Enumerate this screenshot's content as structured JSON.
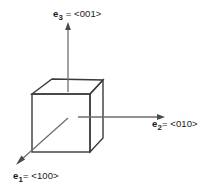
{
  "figure": {
    "background_color": "#ffffff",
    "line_color": "#3a3a3a",
    "text_color": "#1a1a1a"
  },
  "labels": {
    "e3": {
      "vector": "e",
      "subscript": "3",
      "rest": " = <001>",
      "full": "e3 = <001>"
    },
    "e2": {
      "vector": "e",
      "subscript": "2",
      "rest": "= <010>",
      "full": "e2= <010>"
    },
    "e1": {
      "vector": "e",
      "subscript": "1",
      "rest": "= <100>",
      "full": "e1= <100>"
    }
  },
  "geometry": {
    "cube": {
      "front_face": [
        [
          32,
          94
        ],
        [
          90,
          94
        ],
        [
          90,
          152
        ],
        [
          32,
          152
        ]
      ],
      "top_face": [
        [
          32,
          94
        ],
        [
          52,
          79
        ],
        [
          103,
          80
        ],
        [
          90,
          94
        ]
      ],
      "right_face": [
        [
          90,
          94
        ],
        [
          103,
          80
        ],
        [
          103,
          138
        ],
        [
          90,
          152
        ]
      ]
    },
    "axes": [
      {
        "name": "e3",
        "direction": "<001>",
        "from": [
          68,
          92
        ],
        "to": [
          68,
          25
        ]
      },
      {
        "name": "e2",
        "direction": "<010>",
        "from": [
          78,
          117
        ],
        "to": [
          163,
          117
        ]
      },
      {
        "name": "e1",
        "direction": "<100>",
        "from": [
          68,
          118
        ],
        "to": [
          17,
          164
        ]
      }
    ]
  }
}
